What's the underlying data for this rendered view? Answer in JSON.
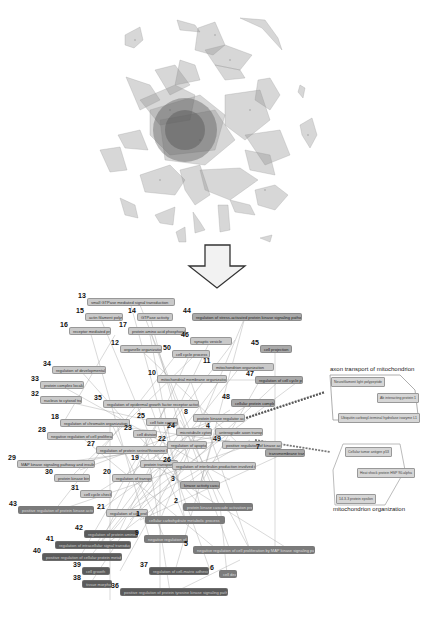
{
  "figure": {
    "top_panel": {
      "description": "Dense overlapping clustered network (gray translucent polygons)"
    },
    "arrow": {
      "direction": "down",
      "label": ""
    },
    "bottom_panel": {
      "nodes": [
        {
          "id": "13",
          "label": "small GTPase mediated signal transduction",
          "x": 87,
          "y": 298,
          "w": 88,
          "level": 1
        },
        {
          "id": "14",
          "label": "GTPase activity",
          "x": 137,
          "y": 313,
          "w": 36,
          "level": 1
        },
        {
          "id": "15",
          "label": "actin filament polymerization",
          "x": 85,
          "y": 313,
          "w": 38,
          "level": 1
        },
        {
          "id": "16",
          "label": "receptor mediated process",
          "x": 69,
          "y": 327,
          "w": 42,
          "level": 1
        },
        {
          "id": "17",
          "label": "protein amino acid phosphorylation",
          "x": 128,
          "y": 327,
          "w": 58,
          "level": 1
        },
        {
          "id": "44",
          "label": "regulation of stress-activated protein kinase signaling pathway",
          "x": 192,
          "y": 313,
          "w": 110,
          "level": 2
        },
        {
          "id": "46",
          "label": "synaptic vesicle",
          "x": 190,
          "y": 337,
          "w": 42,
          "level": 1
        },
        {
          "id": "45",
          "label": "cell projection",
          "x": 260,
          "y": 345,
          "w": 32,
          "level": 2
        },
        {
          "id": "12",
          "label": "organelle organization",
          "x": 120,
          "y": 345,
          "w": 42,
          "level": 1
        },
        {
          "id": "50",
          "label": "cell cycle process",
          "x": 172,
          "y": 350,
          "w": 38,
          "level": 1
        },
        {
          "id": "11",
          "label": "mitochondrion organization",
          "x": 212,
          "y": 363,
          "w": 62,
          "level": 1
        },
        {
          "id": "10",
          "label": "mitochondrial membrane organization",
          "x": 157,
          "y": 375,
          "w": 70,
          "level": 1
        },
        {
          "id": "47",
          "label": "regulation of cell cycle process",
          "x": 255,
          "y": 376,
          "w": 48,
          "level": 2
        },
        {
          "id": "34",
          "label": "regulation of developmental growth",
          "x": 52,
          "y": 366,
          "w": 54,
          "level": 1
        },
        {
          "id": "33",
          "label": "protein complex localization",
          "x": 40,
          "y": 381,
          "w": 44,
          "level": 1
        },
        {
          "id": "32",
          "label": "nucleus to cytosol transport",
          "x": 40,
          "y": 396,
          "w": 42,
          "level": 1
        },
        {
          "id": "35",
          "label": "regulation of epidermal growth factor receptor activity",
          "x": 103,
          "y": 400,
          "w": 96,
          "level": 1
        },
        {
          "id": "48",
          "label": "cellular protein complex",
          "x": 231,
          "y": 399,
          "w": 44,
          "level": 2
        },
        {
          "id": "8",
          "label": "protein kinase regulator activity",
          "x": 193,
          "y": 414,
          "w": 52,
          "level": 1
        },
        {
          "id": "25",
          "label": "cell fate commitment",
          "x": 146,
          "y": 418,
          "w": 32,
          "level": 1
        },
        {
          "id": "18",
          "label": "regulation of chromatin organization",
          "x": 60,
          "y": 419,
          "w": 70,
          "level": 1
        },
        {
          "id": "28",
          "label": "negative regulation of cell proliferation",
          "x": 47,
          "y": 432,
          "w": 66,
          "level": 1
        },
        {
          "id": "23",
          "label": "cell division",
          "x": 133,
          "y": 430,
          "w": 24,
          "level": 1
        },
        {
          "id": "24",
          "label": "microtubule cytoskeleton",
          "x": 176,
          "y": 428,
          "w": 36,
          "level": 1
        },
        {
          "id": "4",
          "label": "anterograde axon transport",
          "x": 215,
          "y": 428,
          "w": 48,
          "level": 1
        },
        {
          "id": "22",
          "label": "regulation of apoptosis",
          "x": 167,
          "y": 441,
          "w": 40,
          "level": 1
        },
        {
          "id": "49",
          "label": "positive regulation of kinase activity",
          "x": 222,
          "y": 441,
          "w": 60,
          "level": 1
        },
        {
          "id": "27",
          "label": "regulation of protein serine/threonine kinase",
          "x": 96,
          "y": 446,
          "w": 72,
          "level": 1
        },
        {
          "id": "7",
          "label": "transmembrane transport",
          "x": 265,
          "y": 449,
          "w": 40,
          "level": 2
        },
        {
          "id": "29",
          "label": "MAP kinase signaling pathway and insulin signaling",
          "x": 17,
          "y": 460,
          "w": 78,
          "level": 1
        },
        {
          "id": "19",
          "label": "protein transport",
          "x": 140,
          "y": 460,
          "w": 38,
          "level": 1
        },
        {
          "id": "26",
          "label": "regulation of interleukin production involved in immune response",
          "x": 172,
          "y": 462,
          "w": 84,
          "level": 1
        },
        {
          "id": "30",
          "label": "protein kinase binding",
          "x": 54,
          "y": 474,
          "w": 36,
          "level": 1
        },
        {
          "id": "20",
          "label": "regulation of transport",
          "x": 112,
          "y": 474,
          "w": 40,
          "level": 1
        },
        {
          "id": "3",
          "label": "kinase activity cascade",
          "x": 180,
          "y": 481,
          "w": 40,
          "level": 2
        },
        {
          "id": "31",
          "label": "cell cycle check point",
          "x": 80,
          "y": 490,
          "w": 32,
          "level": 1
        },
        {
          "id": "2",
          "label": "protein kinase cascade activation process",
          "x": 183,
          "y": 503,
          "w": 70,
          "level": 3
        },
        {
          "id": "43",
          "label": "positive regulation of protein kinase activity",
          "x": 18,
          "y": 506,
          "w": 76,
          "level": 3
        },
        {
          "id": "21",
          "label": "regulation of cell proliferation",
          "x": 106,
          "y": 509,
          "w": 42,
          "level": 1
        },
        {
          "id": "1",
          "label": "cellular carbohydrate metabolic process",
          "x": 145,
          "y": 516,
          "w": 80,
          "level": 3
        },
        {
          "id": "42",
          "label": "regulation of protein amino acid phosphorylation",
          "x": 84,
          "y": 530,
          "w": 54,
          "level": 4
        },
        {
          "id": "9",
          "label": "negative regulation of kinase activity",
          "x": 144,
          "y": 535,
          "w": 44,
          "level": 3
        },
        {
          "id": "41",
          "label": "regulation of intracellular signal transduction",
          "x": 55,
          "y": 541,
          "w": 76,
          "level": 4
        },
        {
          "id": "5",
          "label": "negative regulation of cell proliferation by MAP kinase signaling pathway",
          "x": 193,
          "y": 546,
          "w": 122,
          "level": 3
        },
        {
          "id": "40",
          "label": "positive regulation of cellular protein metabolic process",
          "x": 42,
          "y": 553,
          "w": 80,
          "level": 4
        },
        {
          "id": "39",
          "label": "cell growth",
          "x": 82,
          "y": 567,
          "w": 28,
          "level": 4
        },
        {
          "id": "37",
          "label": "regulation of cell-matrix adhesion",
          "x": 149,
          "y": 567,
          "w": 60,
          "level": 4
        },
        {
          "id": "6",
          "label": "cell death",
          "x": 219,
          "y": 570,
          "w": 18,
          "level": 3
        },
        {
          "id": "38",
          "label": "tissue morphology",
          "x": 82,
          "y": 580,
          "w": 30,
          "level": 4
        },
        {
          "id": "36",
          "label": "positive regulation of protein tyrosine kinase signaling pathway",
          "x": 120,
          "y": 588,
          "w": 108,
          "level": 4
        }
      ]
    },
    "inset_top": {
      "title": "axon transport of mitochondrion",
      "nodes": [
        {
          "label": "Neurofilament light polypeptide",
          "x": 331,
          "y": 377
        },
        {
          "label": "Ab interacting protein 1",
          "x": 377,
          "y": 393
        },
        {
          "label": "Ubiquitin carboxyl-terminal hydrolase isozyme L1",
          "x": 338,
          "y": 413
        }
      ]
    },
    "inset_bottom": {
      "title": "mitochondrion organization",
      "nodes": [
        {
          "label": "Cellular tumor antigen p53",
          "x": 345,
          "y": 447
        },
        {
          "label": "Heat shock protein HSP 90-alpha",
          "x": 357,
          "y": 468
        },
        {
          "label": "14-3-3 protein epsilon",
          "x": 336,
          "y": 494
        }
      ]
    }
  }
}
